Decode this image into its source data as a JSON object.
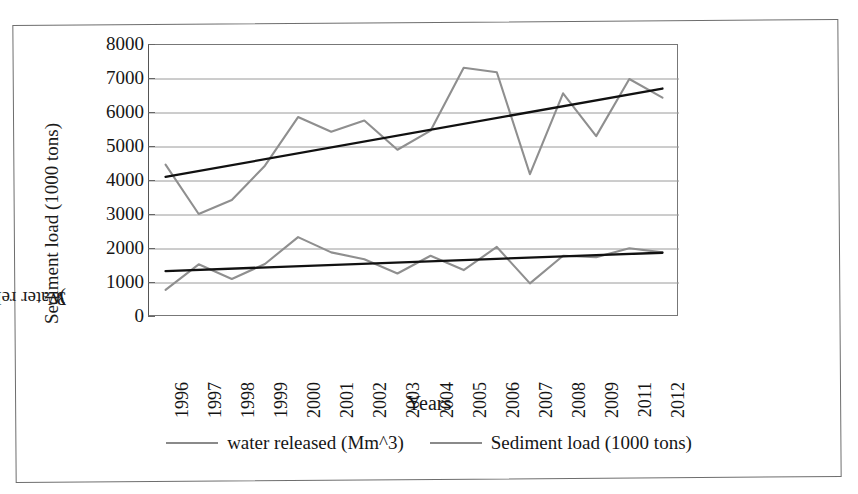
{
  "chart_data": {
    "type": "line",
    "title": "",
    "xlabel": "Years",
    "ylabel_line1": "Sediment load (1000 tons)",
    "ylabel_line2_prefix": "Water released (Mm",
    "ylabel_line2_sup": "3",
    "ylabel_line2_suffix": ")",
    "categories": [
      "1996",
      "1997",
      "1998",
      "1999",
      "2000",
      "2001",
      "2002",
      "2003",
      "2004",
      "2005",
      "2006",
      "2007",
      "2008",
      "2009",
      "2011",
      "2012"
    ],
    "ylim": [
      0,
      8000
    ],
    "yticks": [
      8000,
      7000,
      6000,
      5000,
      4000,
      3000,
      2000,
      1000,
      0
    ],
    "ytick_labels": [
      "8000",
      "7000",
      "6000",
      "5000",
      "4000",
      "3000",
      "2000",
      "1000",
      "0"
    ],
    "grid": true,
    "legend_position": "bottom",
    "series": [
      {
        "name": "water released (Mm^3)",
        "color": "#8f8f8f",
        "values": [
          4480,
          3030,
          3440,
          4450,
          5880,
          5450,
          5780,
          4920,
          5480,
          7330,
          7200,
          4200,
          6580,
          5320,
          7000,
          6450
        ]
      },
      {
        "name": "Sediment load (1000 tons)",
        "color": "#8f8f8f",
        "values": [
          800,
          1550,
          1120,
          1560,
          2350,
          1900,
          1700,
          1280,
          1800,
          1380,
          2060,
          990,
          1800,
          1760,
          2020,
          1900
        ]
      }
    ],
    "trendlines": [
      {
        "name": "water released trendline",
        "color": "#111111",
        "start_value": 4120,
        "end_value": 6720
      },
      {
        "name": "sediment load trendline",
        "color": "#111111",
        "start_value": 1350,
        "end_value": 1890
      }
    ]
  },
  "legend": {
    "items": [
      {
        "label": "water released (Mm^3)",
        "color": "#8f8f8f"
      },
      {
        "label": "Sediment load (1000 tons)",
        "color": "#8a8a8a"
      }
    ]
  }
}
